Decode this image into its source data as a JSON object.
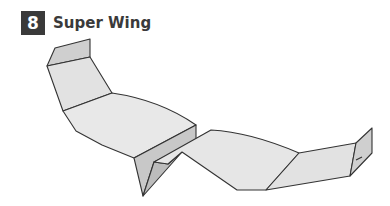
{
  "step": {
    "number": "8",
    "title": "Super Wing"
  },
  "colors": {
    "badge_bg": "#3a3a3a",
    "title_text": "#3a3a3a",
    "panel_light": "#e6e6e6",
    "panel_mid": "#d6d6d6",
    "panel_dark": "#c4c4c4",
    "outline": "#333333"
  },
  "illustration": {
    "subject": "paper airplane - super wing",
    "view": "3/4 perspective"
  }
}
